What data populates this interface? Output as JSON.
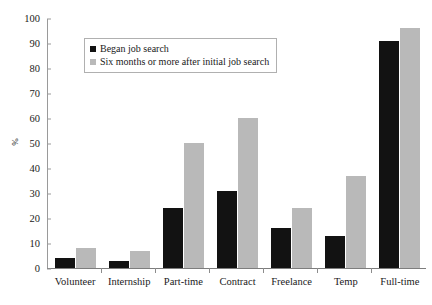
{
  "chart_data": {
    "type": "bar",
    "title": "",
    "xlabel": "",
    "ylabel": "%",
    "ylim": [
      0,
      100
    ],
    "yticks": [
      0,
      10,
      20,
      30,
      40,
      50,
      60,
      70,
      80,
      90,
      100
    ],
    "grid": false,
    "legend_position": "upper-left-inside",
    "categories": [
      "Volunteer",
      "Internship",
      "Part-time",
      "Contract",
      "Freelance",
      "Temp",
      "Full-time"
    ],
    "series": [
      {
        "name": "Began job search",
        "color": "#121212",
        "values": [
          4,
          3,
          24,
          31,
          16,
          13,
          91
        ]
      },
      {
        "name": "Six months or more after initial job search",
        "color": "#b9b9b9",
        "values": [
          8,
          7,
          50,
          60,
          24,
          37,
          96
        ]
      }
    ]
  }
}
